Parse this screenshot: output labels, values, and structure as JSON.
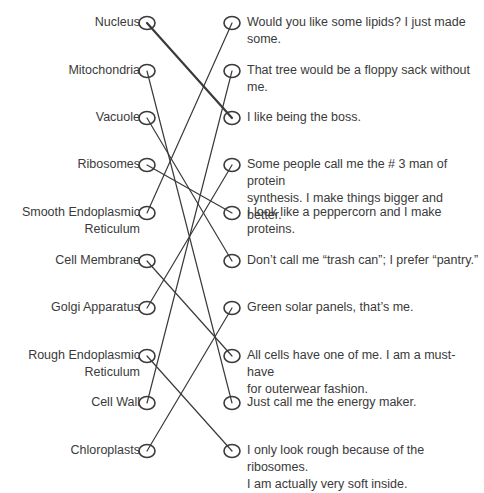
{
  "page": {
    "top_cutoff_text": ""
  },
  "left_items": [
    {
      "label": "Nucleus",
      "y": 23
    },
    {
      "label": "Mitochondria",
      "y": 71
    },
    {
      "label": "Vacuole",
      "y": 118
    },
    {
      "label": "Ribosomes",
      "y": 165
    },
    {
      "label": "Smooth Endoplasmic Reticulum",
      "line1": "Smooth Endoplasmic",
      "line2": "Reticulum",
      "y": 213
    },
    {
      "label": "Cell Membrane",
      "y": 261
    },
    {
      "label": "Golgi Apparatus",
      "y": 308
    },
    {
      "label": "Rough Endoplasmic Reticulum",
      "line1": "Rough Endoplasmic",
      "line2": "Reticulum",
      "y": 356
    },
    {
      "label": "Cell Wall",
      "y": 403
    },
    {
      "label": "Chloroplasts",
      "y": 451
    }
  ],
  "right_items": [
    {
      "line1": "Would you like some lipids? I just made",
      "line2": "some.",
      "y": 23
    },
    {
      "line1": "That tree would be a floppy sack without",
      "line2": "me.",
      "y": 71
    },
    {
      "line1": "I like being the boss.",
      "line2": "",
      "y": 118
    },
    {
      "line1": "Some people call me the # 3 man of protein",
      "line2": "synthesis. I make things bigger and better.",
      "y": 165
    },
    {
      "line1": "I look like a peppercorn and I make",
      "line2": "proteins.",
      "y": 213
    },
    {
      "line1": "Don’t call me “trash can”; I prefer “pantry.”",
      "line2": "",
      "y": 261
    },
    {
      "line1": "Green solar panels, that’s me.",
      "line2": "",
      "y": 308
    },
    {
      "line1": "All cells have one of me. I am a must-have",
      "line2": "for outerwear fashion.",
      "y": 356
    },
    {
      "line1": "Just call me the energy maker.",
      "line2": "",
      "y": 403
    },
    {
      "line1": "I only look rough because of the ribosomes.",
      "line2": "I am actually very soft inside.",
      "y": 451
    }
  ],
  "connections": [
    {
      "left": "Nucleus",
      "right": "I like being the boss.",
      "from": 0,
      "to": 2,
      "bold": true
    },
    {
      "left": "Mitochondria",
      "right": "Just call me the energy maker.",
      "from": 1,
      "to": 8
    },
    {
      "left": "Vacuole",
      "right": "Don’t call me “trash can”; I prefer “pantry.”",
      "from": 2,
      "to": 5
    },
    {
      "left": "Ribosomes",
      "right": "I look like a peppercorn and I make proteins.",
      "from": 3,
      "to": 4
    },
    {
      "left": "Smooth Endoplasmic Reticulum",
      "right": "Would you like some lipids? I just made some.",
      "from": 4,
      "to": 0
    },
    {
      "left": "Cell Membrane",
      "right": "All cells have one of me. I am a must-have for outerwear fashion.",
      "from": 5,
      "to": 7
    },
    {
      "left": "Golgi Apparatus",
      "right": "Some people call me the # 3 man of protein synthesis.",
      "from": 6,
      "to": 3
    },
    {
      "left": "Rough Endoplasmic Reticulum",
      "right": "I only look rough because of the ribosomes.",
      "from": 7,
      "to": 9
    },
    {
      "left": "Cell Wall",
      "right": "That tree would be a floppy sack without me.",
      "from": 8,
      "to": 1
    },
    {
      "left": "Chloroplasts",
      "right": "Green solar panels, that’s me.",
      "from": 9,
      "to": 6
    }
  ],
  "colors": {
    "line": "#3a3a3a",
    "text": "#3a3a3a",
    "background": "#ffffff"
  }
}
